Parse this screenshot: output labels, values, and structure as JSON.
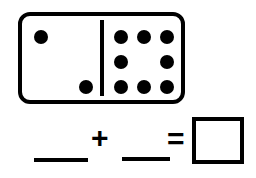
{
  "worksheet": {
    "type": "domino-addition-problem",
    "width": 256,
    "height": 178,
    "background_color": "#ffffff",
    "ink_color": "#000000"
  },
  "domino": {
    "label": "domino tile",
    "left_half": {
      "pip_count": 2,
      "pips": [
        {
          "cx": 37,
          "cy": 33
        },
        {
          "cx": 82,
          "cy": 83
        }
      ]
    },
    "right_half": {
      "pip_count": 8,
      "pattern": "3-2-3",
      "pips": [
        {
          "cx": 117,
          "cy": 33
        },
        {
          "cx": 140,
          "cy": 33
        },
        {
          "cx": 163,
          "cy": 33
        },
        {
          "cx": 117,
          "cy": 58
        },
        {
          "cx": 163,
          "cy": 58
        },
        {
          "cx": 117,
          "cy": 83
        },
        {
          "cx": 140,
          "cy": 83
        },
        {
          "cx": 163,
          "cy": 83
        }
      ]
    }
  },
  "equation": {
    "first_addend_value": "",
    "plus_sign": "+",
    "second_addend_value": "",
    "equals_sign": "=",
    "sum_value": ""
  }
}
